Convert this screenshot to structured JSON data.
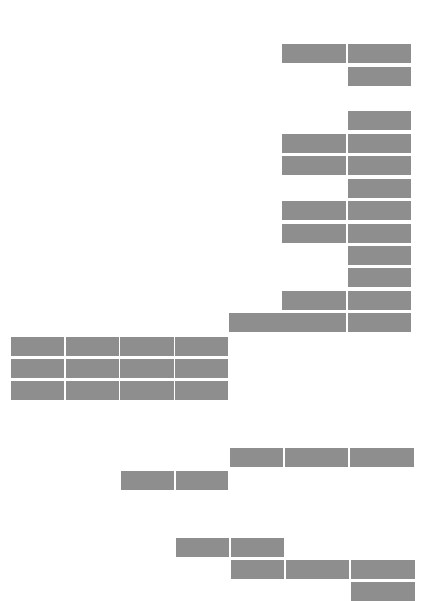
{
  "page": {
    "background_color": "#ffffff",
    "block_color": "#8e8e8e"
  },
  "groups": [
    {
      "name": "right-column-stack",
      "rows": 14
    },
    {
      "name": "left-table",
      "rows": 3,
      "columns": 4
    },
    {
      "name": "lower-fragments",
      "rows": 5
    }
  ]
}
